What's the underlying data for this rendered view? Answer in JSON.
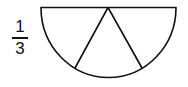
{
  "fraction": {
    "numerator": "1",
    "denominator": "3"
  },
  "diagram": {
    "shape": "semicircle",
    "parts": 3,
    "stroke_color": "#111111",
    "fill_color": "#ffffff"
  }
}
